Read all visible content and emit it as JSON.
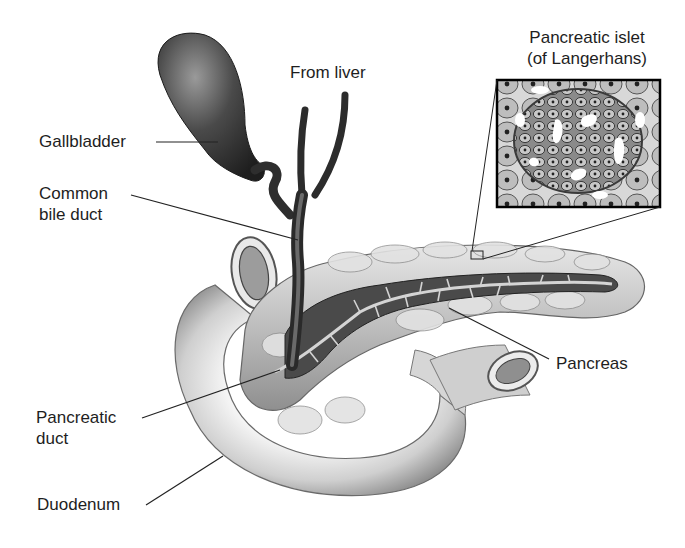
{
  "figure": {
    "style": "grayscale shaded illustration",
    "colors": {
      "background": "#ffffff",
      "label_text": "#1e1e1e",
      "leader_line": "#222222",
      "organ_dark": "#3a3a3a",
      "organ_mid": "#8a8a8a",
      "organ_light": "#d9d9d9"
    }
  },
  "labels": {
    "from_liver": "From liver",
    "gallbladder": "Gallbladder",
    "common_bile_duct": "Common\nbile duct",
    "pancreatic_islet": "Pancreatic islet\n(of Langerhans)",
    "pancreas": "Pancreas",
    "pancreatic_duct": "Pancreatic\nduct",
    "duodenum": "Duodenum"
  },
  "inset": {
    "title": "Pancreatic islet (of Langerhans)",
    "description": "Magnified view of islet cell cluster"
  }
}
